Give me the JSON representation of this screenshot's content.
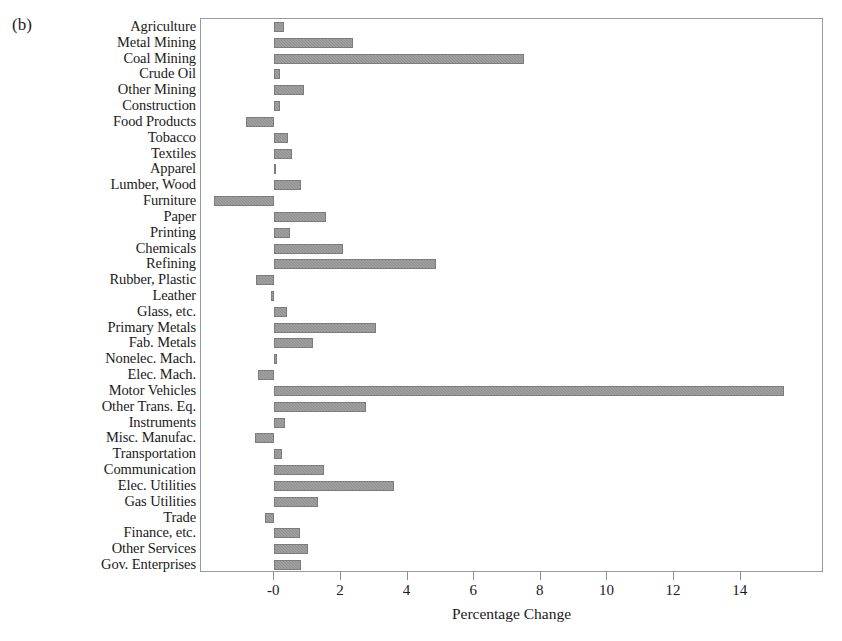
{
  "panel": {
    "label": "(b)"
  },
  "chart_data": {
    "type": "bar",
    "orientation": "horizontal",
    "title": "",
    "subtitle": "",
    "xlabel": "Percentage Change",
    "ylabel": "",
    "xlim": [
      -2.2,
      16.5
    ],
    "xticks": [
      0,
      2,
      4,
      6,
      8,
      10,
      12,
      14
    ],
    "xticklabels": [
      "-0",
      "2",
      "4",
      "6",
      "8",
      "10",
      "12",
      "14"
    ],
    "grid": false,
    "legend": null,
    "zero_line": 0,
    "bar_color": "#8e8e8e",
    "categories": [
      "Agriculture",
      "Metal Mining",
      "Coal Mining",
      "Crude Oil",
      "Other Mining",
      "Construction",
      "Food Products",
      "Tobacco",
      "Textiles",
      "Apparel",
      "Lumber, Wood",
      "Furniture",
      "Paper",
      "Printing",
      "Chemicals",
      "Refining",
      "Rubber, Plastic",
      "Leather",
      "Glass, etc.",
      "Primary Metals",
      "Fab. Metals",
      "Nonelec. Mach.",
      "Elec. Mach.",
      "Motor Vehicles",
      "Other Trans. Eq.",
      "Instruments",
      "Misc. Manufac.",
      "Transportation",
      "Communication",
      "Elec. Utilities",
      "Gas Utilities",
      "Trade",
      "Finance, etc.",
      "Other Services",
      "Gov. Enterprises"
    ],
    "values": [
      0.3,
      2.35,
      7.5,
      0.17,
      0.88,
      0.16,
      -0.85,
      0.4,
      0.54,
      0.05,
      0.8,
      -1.8,
      1.55,
      0.47,
      2.05,
      4.85,
      -0.55,
      -0.1,
      0.37,
      3.05,
      1.15,
      0.07,
      -0.5,
      15.3,
      2.75,
      0.33,
      -0.58,
      0.22,
      1.5,
      3.6,
      1.32,
      -0.27,
      0.78,
      1.0,
      0.8
    ]
  }
}
